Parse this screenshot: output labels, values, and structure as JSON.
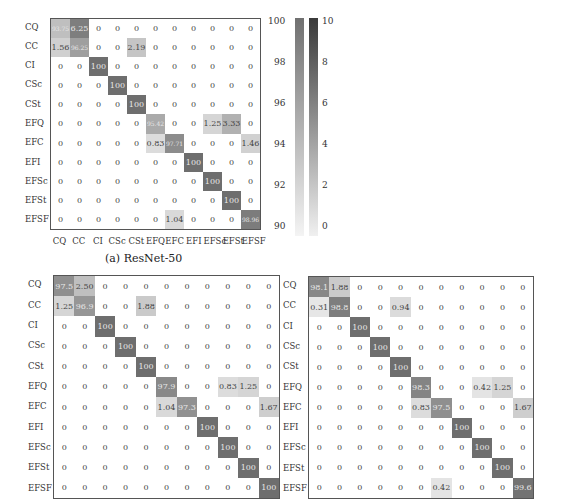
{
  "labels": [
    "CQ",
    "CC",
    "CI",
    "CSc",
    "CSt",
    "EFQ",
    "EFC",
    "EFI",
    "EFSc",
    "EFSt",
    "EFSF"
  ],
  "captions": {
    "a": "(a) ResNet-50"
  },
  "colorbars": {
    "diagonal": {
      "ticks": [
        "100",
        "98",
        "96",
        "94",
        "92",
        "90"
      ],
      "min": 90,
      "max": 100
    },
    "offdiagonal": {
      "ticks": [
        "10",
        "8",
        "6",
        "4",
        "2",
        "0"
      ],
      "min": 0,
      "max": 10
    }
  },
  "chart_data": [
    {
      "type": "heatmap",
      "title": "(a) ResNet-50",
      "xlabel": "",
      "ylabel": "",
      "x": [
        "CQ",
        "CC",
        "CI",
        "CSc",
        "CSt",
        "EFQ",
        "EFC",
        "EFI",
        "EFSc",
        "EFSt",
        "EFSF"
      ],
      "y": [
        "CQ",
        "CC",
        "CI",
        "CSc",
        "CSt",
        "EFQ",
        "EFC",
        "EFI",
        "EFSc",
        "EFSt",
        "EFSF"
      ],
      "values": [
        [
          "93.75",
          "6.25",
          "0",
          "0",
          "0",
          "0",
          "0",
          "0",
          "0",
          "0",
          "0"
        ],
        [
          "1.56",
          "96.25",
          "0",
          "0",
          "2.19",
          "0",
          "0",
          "0",
          "0",
          "0",
          "0"
        ],
        [
          "0",
          "0",
          "100",
          "0",
          "0",
          "0",
          "0",
          "0",
          "0",
          "0",
          "0"
        ],
        [
          "0",
          "0",
          "0",
          "100",
          "0",
          "0",
          "0",
          "0",
          "0",
          "0",
          "0"
        ],
        [
          "0",
          "0",
          "0",
          "0",
          "100",
          "0",
          "0",
          "0",
          "0",
          "0",
          "0"
        ],
        [
          "0",
          "0",
          "0",
          "0",
          "0",
          "95.42",
          "0",
          "0",
          "1.25",
          "3.33",
          "0"
        ],
        [
          "0",
          "0",
          "0",
          "0",
          "0",
          "0.83",
          "97.71",
          "0",
          "0",
          "0",
          "1.46"
        ],
        [
          "0",
          "0",
          "0",
          "0",
          "0",
          "0",
          "0",
          "100",
          "0",
          "0",
          "0"
        ],
        [
          "0",
          "0",
          "0",
          "0",
          "0",
          "0",
          "0",
          "0",
          "100",
          "0",
          "0"
        ],
        [
          "0",
          "0",
          "0",
          "0",
          "0",
          "0",
          "0",
          "0",
          "0",
          "100",
          "0"
        ],
        [
          "0",
          "0",
          "0",
          "0",
          "0",
          "0",
          "1.04",
          "0",
          "0",
          "0",
          "98.96"
        ]
      ],
      "colorbar_diagonal_range": [
        90,
        100
      ],
      "colorbar_offdiagonal_range": [
        0,
        10
      ]
    },
    {
      "type": "heatmap",
      "title": "",
      "x": [
        "CQ",
        "CC",
        "CI",
        "CSc",
        "CSt",
        "EFQ",
        "EFC",
        "EFI",
        "EFSc",
        "EFSt",
        "EFSF"
      ],
      "y": [
        "CQ",
        "CC",
        "CI",
        "CSc",
        "CSt",
        "EFQ",
        "EFC",
        "EFI",
        "EFSc",
        "EFSt",
        "EFSF"
      ],
      "values": [
        [
          "97.5",
          "2.50",
          "0",
          "0",
          "0",
          "0",
          "0",
          "0",
          "0",
          "0",
          "0"
        ],
        [
          "1.25",
          "96.9",
          "0",
          "0",
          "1.88",
          "0",
          "0",
          "0",
          "0",
          "0",
          "0"
        ],
        [
          "0",
          "0",
          "100",
          "0",
          "0",
          "0",
          "0",
          "0",
          "0",
          "0",
          "0"
        ],
        [
          "0",
          "0",
          "0",
          "100",
          "0",
          "0",
          "0",
          "0",
          "0",
          "0",
          "0"
        ],
        [
          "0",
          "0",
          "0",
          "0",
          "100",
          "0",
          "0",
          "0",
          "0",
          "0",
          "0"
        ],
        [
          "0",
          "0",
          "0",
          "0",
          "0",
          "97.9",
          "0",
          "0",
          "0.83",
          "1.25",
          "0"
        ],
        [
          "0",
          "0",
          "0",
          "0",
          "0",
          "1.04",
          "97.3",
          "0",
          "0",
          "0",
          "1.67"
        ],
        [
          "0",
          "0",
          "0",
          "0",
          "0",
          "0",
          "0",
          "100",
          "0",
          "0",
          "0"
        ],
        [
          "0",
          "0",
          "0",
          "0",
          "0",
          "0",
          "0",
          "0",
          "100",
          "0",
          "0"
        ],
        [
          "0",
          "0",
          "0",
          "0",
          "0",
          "0",
          "0",
          "0",
          "0",
          "100",
          "0"
        ],
        [
          "0",
          "0",
          "0",
          "0",
          "0",
          "0",
          "0",
          "0",
          "0",
          "0",
          "100"
        ]
      ]
    },
    {
      "type": "heatmap",
      "title": "",
      "x": [
        "CQ",
        "CC",
        "CI",
        "CSc",
        "CSt",
        "EFQ",
        "EFC",
        "EFI",
        "EFSc",
        "EFSt",
        "EFSF"
      ],
      "y": [
        "CQ",
        "CC",
        "CI",
        "CSc",
        "CSt",
        "EFQ",
        "EFC",
        "EFI",
        "EFSc",
        "EFSt",
        "EFSF"
      ],
      "values": [
        [
          "98.1",
          "1.88",
          "0",
          "0",
          "0",
          "0",
          "0",
          "0",
          "0",
          "0",
          "0"
        ],
        [
          "0.31",
          "98.8",
          "0",
          "0",
          "0.94",
          "0",
          "0",
          "0",
          "0",
          "0",
          "0"
        ],
        [
          "0",
          "0",
          "100",
          "0",
          "0",
          "0",
          "0",
          "0",
          "0",
          "0",
          "0"
        ],
        [
          "0",
          "0",
          "0",
          "100",
          "0",
          "0",
          "0",
          "0",
          "0",
          "0",
          "0"
        ],
        [
          "0",
          "0",
          "0",
          "0",
          "100",
          "0",
          "0",
          "0",
          "0",
          "0",
          "0"
        ],
        [
          "0",
          "0",
          "0",
          "0",
          "0",
          "98.3",
          "0",
          "0",
          "0.42",
          "1.25",
          "0"
        ],
        [
          "0",
          "0",
          "0",
          "0",
          "0",
          "0.83",
          "97.5",
          "0",
          "0",
          "0",
          "1.67"
        ],
        [
          "0",
          "0",
          "0",
          "0",
          "0",
          "0",
          "0",
          "100",
          "0",
          "0",
          "0"
        ],
        [
          "0",
          "0",
          "0",
          "0",
          "0",
          "0",
          "0",
          "0",
          "100",
          "0",
          "0"
        ],
        [
          "0",
          "0",
          "0",
          "0",
          "0",
          "0",
          "0",
          "0",
          "0",
          "100",
          "0"
        ],
        [
          "0",
          "0",
          "0",
          "0",
          "0",
          "0",
          "0.42",
          "0",
          "0",
          "0",
          "99.6"
        ]
      ]
    }
  ]
}
